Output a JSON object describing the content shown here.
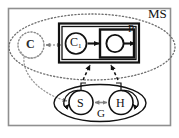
{
  "figure": {
    "frame": {
      "name": "outer-frame",
      "color": "#8a8a8a"
    }
  },
  "labels": {
    "ms": "MS",
    "p": "P",
    "c": "C",
    "c1": "C",
    "c1_subscript": "1",
    "g": "G",
    "s": "S",
    "h": "H"
  },
  "nodes": [
    {
      "id": "ms",
      "label": "MS",
      "shape": "ellipse",
      "style": "dotted",
      "label_pos": "top-right",
      "cx": 92,
      "cy": 47,
      "rx": 83,
      "ry": 34
    },
    {
      "id": "c",
      "label": "C",
      "shape": "circle",
      "style": "dotted",
      "cx": 31,
      "cy": 45,
      "r": 12
    },
    {
      "id": "p",
      "label": "P",
      "shape": "rect",
      "style": "double-solid-thick",
      "label_pos": "top-right-inside",
      "x": 60,
      "y": 24,
      "w": 78,
      "h": 38
    },
    {
      "id": "c1",
      "label": "C1",
      "shape": "circle",
      "style": "solid",
      "cx": 75,
      "cy": 43,
      "r": 11
    },
    {
      "id": "pbox",
      "label": "",
      "shape": "rect",
      "style": "solid-thick",
      "x": 100,
      "y": 30,
      "w": 34,
      "h": 26
    },
    {
      "id": "pcirc",
      "label": "",
      "shape": "circle",
      "style": "solid",
      "cx": 114,
      "cy": 43,
      "r": 9
    },
    {
      "id": "g",
      "label": "G",
      "shape": "ellipse",
      "style": "solid",
      "label_pos": "bottom-center-inside",
      "cx": 98,
      "cy": 105,
      "rx": 46,
      "ry": 19
    },
    {
      "id": "s",
      "label": "S",
      "shape": "circle",
      "style": "solid",
      "cx": 80,
      "cy": 103,
      "r": 12
    },
    {
      "id": "h",
      "label": "H",
      "shape": "circle",
      "style": "solid",
      "cx": 122,
      "cy": 103,
      "r": 12
    }
  ],
  "edges": [
    {
      "id": "c-to-c1",
      "from": "c",
      "to": "c1",
      "style": "dotted",
      "arrow": "double"
    },
    {
      "id": "c1-to-pbox",
      "from": "c1",
      "to": "pbox",
      "style": "solid",
      "arrow": "single"
    },
    {
      "id": "pbox-in",
      "from": "",
      "to": "pcirc",
      "style": "solid",
      "arrow": "single"
    },
    {
      "id": "pbox-out",
      "from": "pcirc",
      "to": "",
      "style": "solid",
      "arrow": "single"
    },
    {
      "id": "s-to-h",
      "from": "s",
      "to": "h",
      "style": "solid",
      "arrow": "double"
    },
    {
      "id": "s-selfloop",
      "from": "s",
      "to": "s",
      "style": "solid",
      "arrow": "single"
    },
    {
      "id": "h-selfloop",
      "from": "h",
      "to": "h",
      "style": "solid",
      "arrow": "single"
    },
    {
      "id": "g-to-p-left",
      "from": "g",
      "to": "p",
      "style": "dashed",
      "arrow": "single"
    },
    {
      "id": "g-to-p-right",
      "from": "g",
      "to": "p",
      "style": "dashed",
      "arrow": "single"
    },
    {
      "id": "c-to-s",
      "from": "c",
      "to": "s",
      "style": "dotted",
      "arrow": "single"
    }
  ]
}
